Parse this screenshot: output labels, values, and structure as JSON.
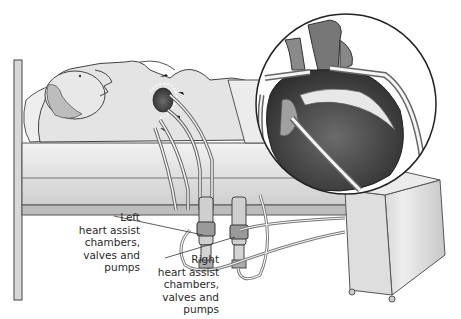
{
  "figure": {
    "inset_subject": "Magnified heart with cannulae connected",
    "labels": {
      "left": "Left\nheart assist\nchambers,\nvalves and\npumps",
      "right": "Right\nheart assist\nchambers,\nvalves and\npumps"
    },
    "colors": {
      "background": "#ffffff",
      "line": "#333333",
      "bed": "#e6e6e6",
      "body": "#e2e2e2",
      "heart_dark": "#5a5a5a"
    }
  }
}
